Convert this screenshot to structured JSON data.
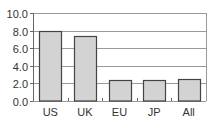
{
  "chart_data": {
    "type": "bar",
    "title": "",
    "xlabel": "",
    "ylabel": "",
    "categories": [
      "US",
      "UK",
      "EU",
      "JP",
      "All"
    ],
    "values": [
      8.0,
      7.4,
      2.4,
      2.4,
      2.5
    ],
    "ylim": [
      0,
      10
    ],
    "yticks": [
      "0.0",
      "2.0",
      "4.0",
      "6.0",
      "8.0",
      "10.0"
    ],
    "grid": true,
    "legend": null,
    "bar_color": "#d3d3d3",
    "bar_edge_color": "#444444",
    "grid_color": "#999999"
  }
}
